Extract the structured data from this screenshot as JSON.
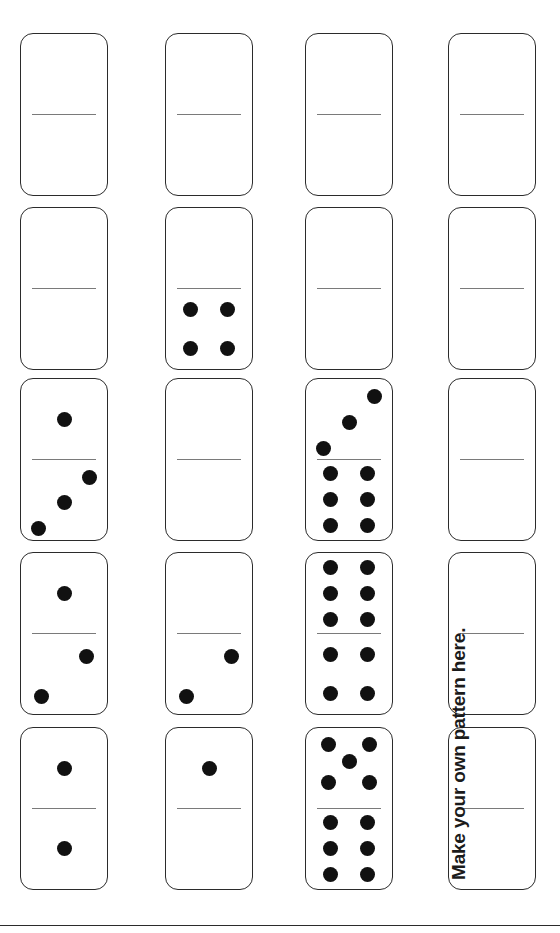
{
  "page": {
    "width": 560,
    "height": 933,
    "background_color": "#ffffff",
    "orientation": "rotated-90-ccw",
    "border_color": "#2b2b2b",
    "divider_color": "#7a7a7a",
    "pip_color": "#111111"
  },
  "caption": {
    "text": "Make your own pattern here.",
    "rotation_deg": -90,
    "x": 448,
    "y": 880,
    "color": "#1b1b1b"
  },
  "bottom_rule": {
    "y": 925,
    "color": "#2b2b2b"
  },
  "grid": {
    "columns": 4,
    "rows": 5,
    "column_x": [
      20,
      165,
      305,
      448
    ],
    "row_y": [
      33,
      207,
      378,
      552,
      727
    ],
    "domino_width": 88,
    "domino_height": 163
  },
  "dominoes": [
    {
      "id": "domino-c1-r1",
      "column": 1,
      "row": 1,
      "x": 20,
      "y": 33,
      "top": 0,
      "bottom": 0
    },
    {
      "id": "domino-c2-r1",
      "column": 2,
      "row": 1,
      "x": 165,
      "y": 33,
      "top": 0,
      "bottom": 0
    },
    {
      "id": "domino-c3-r1",
      "column": 3,
      "row": 1,
      "x": 305,
      "y": 33,
      "top": 0,
      "bottom": 0
    },
    {
      "id": "domino-c4-r1",
      "column": 4,
      "row": 1,
      "x": 448,
      "y": 33,
      "top": 0,
      "bottom": 0
    },
    {
      "id": "domino-c1-r2",
      "column": 1,
      "row": 2,
      "x": 20,
      "y": 207,
      "top": 0,
      "bottom": 0
    },
    {
      "id": "domino-c2-r2",
      "column": 2,
      "row": 2,
      "x": 165,
      "y": 207,
      "top": 0,
      "bottom": 4
    },
    {
      "id": "domino-c3-r2",
      "column": 3,
      "row": 2,
      "x": 305,
      "y": 207,
      "top": 0,
      "bottom": 0
    },
    {
      "id": "domino-c4-r2",
      "column": 4,
      "row": 2,
      "x": 448,
      "y": 207,
      "top": 0,
      "bottom": 0
    },
    {
      "id": "domino-c1-r3",
      "column": 1,
      "row": 3,
      "x": 20,
      "y": 378,
      "top": 1,
      "bottom": 3
    },
    {
      "id": "domino-c2-r3",
      "column": 2,
      "row": 3,
      "x": 165,
      "y": 378,
      "top": 0,
      "bottom": 0
    },
    {
      "id": "domino-c3-r3",
      "column": 3,
      "row": 3,
      "x": 305,
      "y": 378,
      "top": 3,
      "bottom": 6
    },
    {
      "id": "domino-c4-r3",
      "column": 4,
      "row": 3,
      "x": 448,
      "y": 378,
      "top": 0,
      "bottom": 0
    },
    {
      "id": "domino-c1-r4",
      "column": 1,
      "row": 4,
      "x": 20,
      "y": 552,
      "top": 1,
      "bottom": 2
    },
    {
      "id": "domino-c2-r4",
      "column": 2,
      "row": 4,
      "x": 165,
      "y": 552,
      "top": 0,
      "bottom": 2
    },
    {
      "id": "domino-c3-r4",
      "column": 3,
      "row": 4,
      "x": 305,
      "y": 552,
      "top": 6,
      "bottom": 4
    },
    {
      "id": "domino-c4-r4",
      "column": 4,
      "row": 4,
      "x": 448,
      "y": 552,
      "top": 0,
      "bottom": 0
    },
    {
      "id": "domino-c1-r5",
      "column": 1,
      "row": 5,
      "x": 20,
      "y": 727,
      "top": 1,
      "bottom": 1
    },
    {
      "id": "domino-c2-r5",
      "column": 2,
      "row": 5,
      "x": 165,
      "y": 727,
      "top": 1,
      "bottom": 0
    },
    {
      "id": "domino-c3-r5",
      "column": 3,
      "row": 5,
      "x": 305,
      "y": 727,
      "top": 5,
      "bottom": 6
    },
    {
      "id": "domino-c4-r5",
      "column": 4,
      "row": 5,
      "x": 448,
      "y": 727,
      "top": 0,
      "bottom": 0
    }
  ],
  "pip_layouts": {
    "0": [],
    "1": [
      [
        50,
        50
      ]
    ],
    "2": [
      [
        24,
        78
      ],
      [
        76,
        28
      ]
    ],
    "3": [
      [
        20,
        86
      ],
      [
        50,
        54
      ],
      [
        80,
        22
      ]
    ],
    "4": [
      [
        28,
        26
      ],
      [
        72,
        26
      ],
      [
        28,
        74
      ],
      [
        72,
        74
      ]
    ],
    "5": [
      [
        26,
        20
      ],
      [
        74,
        20
      ],
      [
        50,
        42
      ],
      [
        26,
        68
      ],
      [
        74,
        68
      ]
    ],
    "6": [
      [
        28,
        18
      ],
      [
        72,
        18
      ],
      [
        28,
        50
      ],
      [
        72,
        50
      ],
      [
        28,
        82
      ],
      [
        72,
        82
      ]
    ]
  }
}
